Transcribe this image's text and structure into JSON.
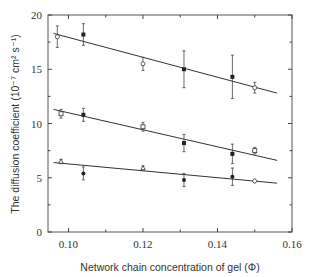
{
  "chart_data": {
    "type": "scatter",
    "title": "",
    "xlabel": "Network chain concentration of gel (Φ)",
    "ylabel": "The diffusion coefficient (10⁻⁷ cm² s⁻¹)",
    "xlim": [
      0.0945,
      0.16
    ],
    "ylim": [
      0,
      20
    ],
    "x_ticks": [
      0.1,
      0.12,
      0.14,
      0.16
    ],
    "x_tick_labels": [
      "0.10",
      "0.12",
      "0.14",
      "0.16"
    ],
    "x_minor_ticks": [
      0.11,
      0.13,
      0.15
    ],
    "y_ticks": [
      0,
      5,
      10,
      15,
      20
    ],
    "y_tick_labels": [
      "0",
      "5",
      "10",
      "15",
      "20"
    ],
    "y_minor_ticks": [
      2.5,
      7.5,
      12.5,
      17.5
    ],
    "grid": false,
    "legend": null,
    "series": [
      {
        "name": "top group",
        "points": [
          {
            "x": 0.097,
            "y": 18.0,
            "err": 1.0,
            "marker": "open-circle"
          },
          {
            "x": 0.104,
            "y": 18.2,
            "err": 1.0,
            "marker": "filled-square"
          },
          {
            "x": 0.12,
            "y": 15.5,
            "err": 0.6,
            "marker": "open-circle"
          },
          {
            "x": 0.131,
            "y": 15.0,
            "err": 1.7,
            "marker": "filled-square"
          },
          {
            "x": 0.144,
            "y": 14.3,
            "err": 2.0,
            "marker": "filled-square"
          },
          {
            "x": 0.15,
            "y": 13.3,
            "err": 0.5,
            "marker": "open-circle"
          }
        ],
        "fit_line": [
          [
            0.096,
            18.3
          ],
          [
            0.156,
            12.8
          ]
        ]
      },
      {
        "name": "middle group",
        "points": [
          {
            "x": 0.098,
            "y": 10.9,
            "err": 0.4,
            "marker": "open-square"
          },
          {
            "x": 0.104,
            "y": 10.8,
            "err": 0.6,
            "marker": "filled-square"
          },
          {
            "x": 0.12,
            "y": 9.7,
            "err": 0.4,
            "marker": "open-square"
          },
          {
            "x": 0.131,
            "y": 8.2,
            "err": 0.8,
            "marker": "filled-square"
          },
          {
            "x": 0.144,
            "y": 7.2,
            "err": 0.9,
            "marker": "filled-square"
          },
          {
            "x": 0.15,
            "y": 7.5,
            "err": 0.3,
            "marker": "open-square"
          }
        ],
        "fit_line": [
          [
            0.096,
            11.3
          ],
          [
            0.156,
            6.6
          ]
        ]
      },
      {
        "name": "bottom group",
        "points": [
          {
            "x": 0.098,
            "y": 6.5,
            "err": 0.2,
            "marker": "open-triangle"
          },
          {
            "x": 0.104,
            "y": 5.4,
            "err": 0.6,
            "marker": "filled-circle"
          },
          {
            "x": 0.12,
            "y": 5.9,
            "err": 0.2,
            "marker": "open-triangle"
          },
          {
            "x": 0.131,
            "y": 4.8,
            "err": 0.6,
            "marker": "filled-circle"
          },
          {
            "x": 0.144,
            "y": 5.1,
            "err": 0.8,
            "marker": "filled-circle"
          },
          {
            "x": 0.15,
            "y": 4.7,
            "err": 0.15,
            "marker": "open-diamond"
          }
        ],
        "fit_line": [
          [
            0.096,
            6.4
          ],
          [
            0.156,
            4.5
          ]
        ]
      }
    ]
  }
}
